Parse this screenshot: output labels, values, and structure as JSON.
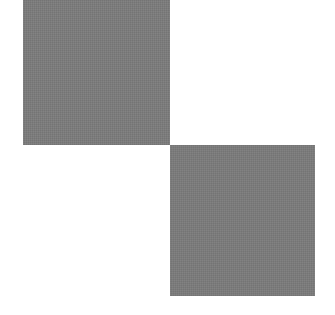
{
  "canvas": {
    "width": 335,
    "height": 315,
    "background": "#ffffff"
  },
  "shapes": [
    {
      "name": "top-left-square",
      "color": "#7b7b7b"
    },
    {
      "name": "bottom-right-square",
      "color": "#7b7b7b"
    }
  ]
}
